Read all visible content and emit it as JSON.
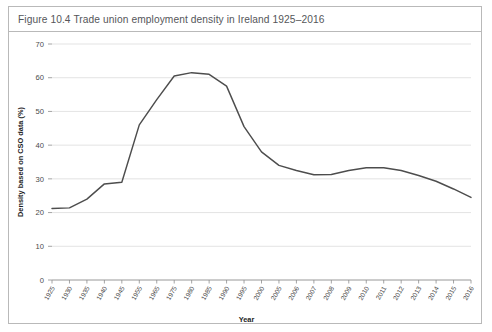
{
  "figure": {
    "label": "Figure 10.4",
    "title": "Figure 10.4  Trade union employment density in Ireland 1925–2016"
  },
  "chart_data": {
    "type": "line",
    "title": "Trade union employment density in Ireland 1925–2016",
    "xlabel": "Year",
    "ylabel": "Density based on CSO data (%)",
    "ylim": [
      0,
      70
    ],
    "yticks": [
      0,
      10,
      20,
      30,
      40,
      50,
      60,
      70
    ],
    "ytick_labels": [
      "0",
      "10",
      "20",
      "30",
      "40",
      "50",
      "60",
      "70"
    ],
    "grid": true,
    "legend": "none",
    "categories": [
      "1925",
      "1930",
      "1935",
      "1940",
      "1945",
      "1955",
      "1965",
      "1975",
      "1980",
      "1985",
      "1990",
      "1995",
      "2000",
      "2005",
      "2006",
      "2007",
      "2008",
      "2009",
      "2010",
      "2011",
      "2012",
      "2013",
      "2014",
      "2015",
      "2016"
    ],
    "values": [
      21.2,
      21.4,
      24.0,
      28.5,
      29.0,
      46.0,
      53.5,
      60.5,
      61.5,
      61.0,
      57.5,
      45.5,
      38.0,
      34.0,
      32.5,
      31.2,
      31.3,
      32.5,
      33.3,
      33.3,
      32.5,
      31.0,
      29.3,
      27.0,
      24.5
    ],
    "series": [
      {
        "name": "Trade union employment density",
        "color": "#4d4d4d",
        "values": [
          21.2,
          21.4,
          24.0,
          28.5,
          29.0,
          46.0,
          53.5,
          60.5,
          61.5,
          61.0,
          57.5,
          45.5,
          38.0,
          34.0,
          32.5,
          31.2,
          31.3,
          32.5,
          33.3,
          33.3,
          32.5,
          31.0,
          29.3,
          27.0,
          24.5
        ]
      }
    ]
  },
  "colors": {
    "line": "#4d4d4d",
    "grid": "#dcdcdc",
    "axis": "#8d8d8d",
    "border": "#b9b9b9",
    "title_text": "#55565a"
  }
}
